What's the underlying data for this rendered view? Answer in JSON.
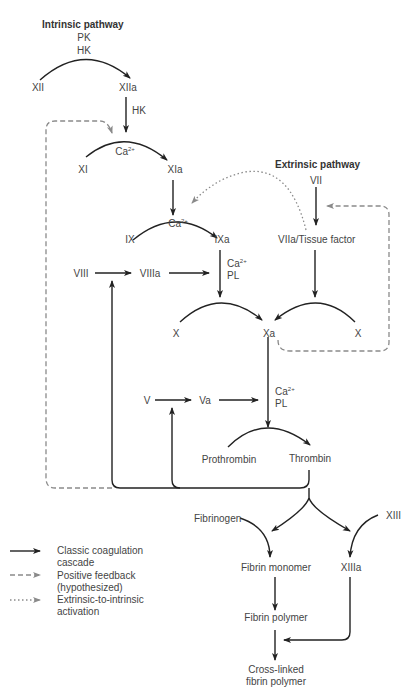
{
  "diagram": {
    "title_intrinsic": "Intrinsic pathway",
    "title_extrinsic": "Extrinsic pathway",
    "nodes": {
      "PK": "PK",
      "HK_top": "HK",
      "XII": "XII",
      "XIIa": "XIIa",
      "HK_mid": "HK",
      "XI": "XI",
      "XIa": "XIa",
      "IX": "IX",
      "IXa": "IXa",
      "VII": "VII",
      "VIIa_TF": "VIIa/Tissue factor",
      "VIII": "VIII",
      "VIIIa": "VIIIa",
      "X_left": "X",
      "Xa": "Xa",
      "X_right": "X",
      "V": "V",
      "Va": "Va",
      "Prothrombin": "Prothrombin",
      "Thrombin": "Thrombin",
      "Fibrinogen": "Fibrinogen",
      "XIII": "XIII",
      "Fibrin_monomer": "Fibrin monomer",
      "XIIIa": "XIIIa",
      "Fibrin_polymer": "Fibrin polymer",
      "Crosslinked_1": "Cross-linked",
      "Crosslinked_2": "fibrin polymer"
    },
    "cofactors": {
      "ca": "Ca",
      "ca_sup": "2+",
      "pl": "PL"
    }
  },
  "legend": {
    "items": [
      {
        "line1": "Classic coagulation",
        "line2": "cascade",
        "style": "solid"
      },
      {
        "line1": "Positive feedback",
        "line2": "(hypothesized)",
        "style": "dashed"
      },
      {
        "line1": "Extrinsic-to-intrinsic",
        "line2": "activation",
        "style": "dotted"
      }
    ]
  },
  "colors": {
    "solid": "#222222",
    "dashed": "#8a8a8a",
    "dotted": "#8a8a8a",
    "text": "#444444"
  }
}
